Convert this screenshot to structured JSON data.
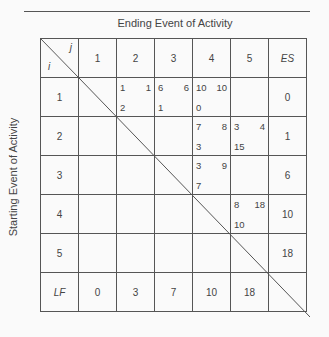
{
  "title": "Ending Event of Activity",
  "side_label": "Starting Event of Activity",
  "corner": {
    "j": "j",
    "i": "i"
  },
  "columns": [
    "1",
    "2",
    "3",
    "4",
    "5",
    "ES"
  ],
  "rows": [
    {
      "label": "1",
      "es": "0",
      "cells": {
        "2": {
          "tl": "1",
          "tr": "1",
          "bl": "2"
        },
        "3": {
          "tl": "6",
          "tr": "6",
          "bl": "1"
        },
        "4": {
          "tl": "10",
          "tr": "10",
          "bl": "0"
        }
      }
    },
    {
      "label": "2",
      "es": "1",
      "cells": {
        "4": {
          "tl": "7",
          "tr": "8",
          "bl": "3"
        },
        "5": {
          "tl": "3",
          "tr": "4",
          "bl": "15"
        }
      }
    },
    {
      "label": "3",
      "es": "6",
      "cells": {
        "4": {
          "tl": "3",
          "tr": "9",
          "bl": "7"
        }
      }
    },
    {
      "label": "4",
      "es": "10",
      "cells": {
        "5": {
          "tl": "8",
          "tr": "18",
          "bl": "10"
        }
      }
    },
    {
      "label": "5",
      "es": "18",
      "cells": {}
    }
  ],
  "lf_row": {
    "label": "LF",
    "values": [
      "0",
      "3",
      "7",
      "10",
      "18"
    ]
  }
}
